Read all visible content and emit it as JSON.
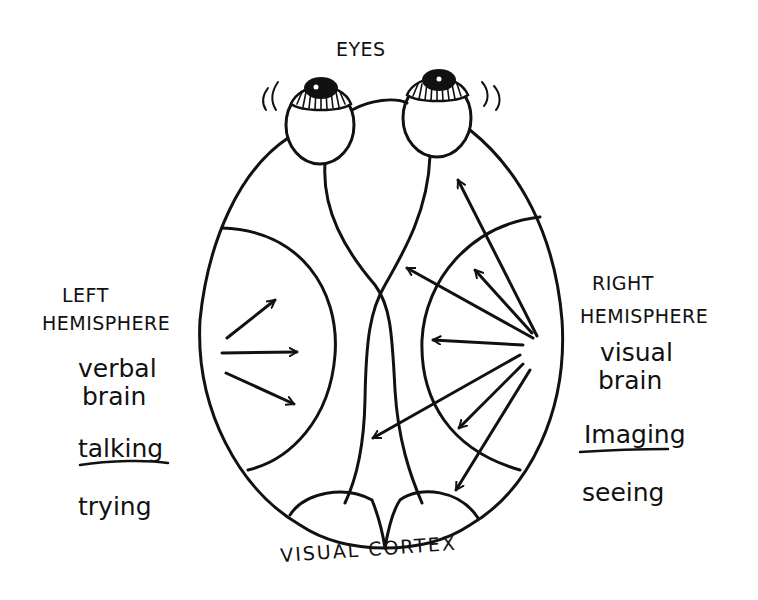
{
  "diagram": {
    "title": "EYES",
    "bottom_label": "VISUAL CORTEX",
    "left": {
      "heading_line1": "LEFT",
      "heading_line2": "HEMISPHERE",
      "desc_line1": "verbal",
      "desc_line2": "brain",
      "keyword": "talking",
      "action": "trying"
    },
    "right": {
      "heading_line1": "RIGHT",
      "heading_line2": "HEMISPHERE",
      "desc_line1": "visual",
      "desc_line2": "brain",
      "keyword": "Imaging",
      "action": "seeing"
    },
    "colors": {
      "ink": "#111111",
      "background": "#ffffff"
    }
  }
}
